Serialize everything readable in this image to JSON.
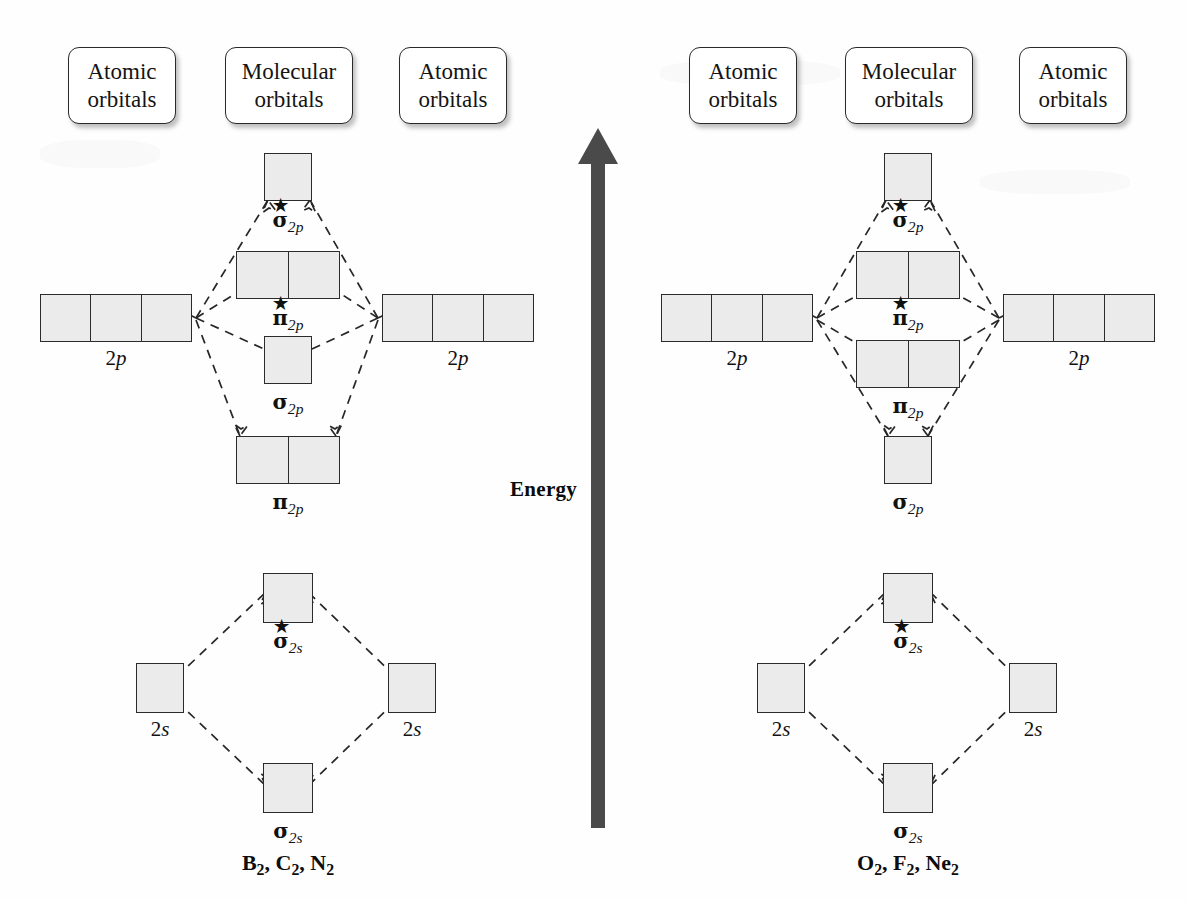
{
  "figure": {
    "energy_axis_label": "Energy",
    "arrow_direction": "up",
    "arrow_color": "#4a4a4a",
    "box_fill_color": "#ebebeb",
    "box_border_color": "#2b2b2b",
    "connector_style": "dashed"
  },
  "column_headers": [
    {
      "line1": "Atomic",
      "line2": "orbitals"
    },
    {
      "line1": "Molecular",
      "line2": "orbitals"
    },
    {
      "line1": "Atomic",
      "line2": "orbitals"
    },
    {
      "line1": "Atomic",
      "line2": "orbitals"
    },
    {
      "line1": "Molecular",
      "line2": "orbitals"
    },
    {
      "line1": "Atomic",
      "line2": "orbitals"
    }
  ],
  "diagrams": [
    {
      "id": "left",
      "caption": "B2, C2, N2",
      "caption_parts": [
        {
          "sym": "B",
          "n": "2",
          "sep": ", "
        },
        {
          "sym": "C",
          "n": "2",
          "sep": ", "
        },
        {
          "sym": "N",
          "n": "2",
          "sep": ""
        }
      ],
      "atomic_orbitals": [
        {
          "label": "2p",
          "n": "2",
          "orb": "p",
          "cells": 3,
          "side": "left"
        },
        {
          "label": "2p",
          "n": "2",
          "orb": "p",
          "cells": 3,
          "side": "right"
        },
        {
          "label": "2s",
          "n": "2",
          "orb": "s",
          "cells": 1,
          "side": "left"
        },
        {
          "label": "2s",
          "n": "2",
          "orb": "s",
          "cells": 1,
          "side": "right"
        }
      ],
      "molecular_orbitals": [
        {
          "label": "sigma*2p",
          "greek": "σ",
          "star": true,
          "sub": "2p",
          "cells": 1
        },
        {
          "label": "pi*2p",
          "greek": "π",
          "star": true,
          "sub": "2p",
          "cells": 2
        },
        {
          "label": "sigma2p",
          "greek": "σ",
          "star": false,
          "sub": "2p",
          "cells": 1
        },
        {
          "label": "pi2p",
          "greek": "π",
          "star": false,
          "sub": "2p",
          "cells": 2
        },
        {
          "label": "sigma*2s",
          "greek": "σ",
          "star": true,
          "sub": "2s",
          "cells": 1
        },
        {
          "label": "sigma2s",
          "greek": "σ",
          "star": false,
          "sub": "2s",
          "cells": 1
        }
      ]
    },
    {
      "id": "right",
      "caption": "O2, F2, Ne2",
      "caption_parts": [
        {
          "sym": "O",
          "n": "2",
          "sep": ", "
        },
        {
          "sym": "F",
          "n": "2",
          "sep": ", "
        },
        {
          "sym": "Ne",
          "n": "2",
          "sep": ""
        }
      ],
      "atomic_orbitals": [
        {
          "label": "2p",
          "n": "2",
          "orb": "p",
          "cells": 3,
          "side": "left"
        },
        {
          "label": "2p",
          "n": "2",
          "orb": "p",
          "cells": 3,
          "side": "right"
        },
        {
          "label": "2s",
          "n": "2",
          "orb": "s",
          "cells": 1,
          "side": "left"
        },
        {
          "label": "2s",
          "n": "2",
          "orb": "s",
          "cells": 1,
          "side": "right"
        }
      ],
      "molecular_orbitals": [
        {
          "label": "sigma*2p",
          "greek": "σ",
          "star": true,
          "sub": "2p",
          "cells": 1
        },
        {
          "label": "pi*2p",
          "greek": "π",
          "star": true,
          "sub": "2p",
          "cells": 2
        },
        {
          "label": "pi2p",
          "greek": "π",
          "star": false,
          "sub": "2p",
          "cells": 2
        },
        {
          "label": "sigma2p",
          "greek": "σ",
          "star": false,
          "sub": "2p",
          "cells": 1
        },
        {
          "label": "sigma*2s",
          "greek": "σ",
          "star": true,
          "sub": "2s",
          "cells": 1
        },
        {
          "label": "sigma2s",
          "greek": "σ",
          "star": false,
          "sub": "2s",
          "cells": 1
        }
      ]
    }
  ],
  "glyphs": {
    "sigma": "σ",
    "pi": "π",
    "star": "★",
    "two": "2",
    "p": "p",
    "s": "s"
  }
}
